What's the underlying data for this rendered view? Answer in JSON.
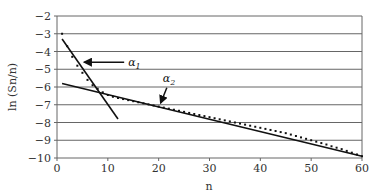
{
  "chart_data": {
    "type": "line",
    "title": "",
    "xlabel": "n",
    "ylabel": "ln (Sn/n)",
    "xlim": [
      0,
      60
    ],
    "ylim": [
      -10,
      -2
    ],
    "xticks": [
      0,
      10,
      20,
      30,
      40,
      50,
      60
    ],
    "yticks": [
      -2,
      -3,
      -4,
      -5,
      -6,
      -7,
      -8,
      -9,
      -10
    ],
    "grid": "horizontal",
    "legend": "none",
    "series": [
      {
        "name": "data",
        "style": "dotted-markers",
        "x": [
          1,
          2,
          3,
          4,
          5,
          6,
          7,
          8,
          9,
          10,
          11,
          12,
          13,
          14,
          15,
          16,
          17,
          18,
          19,
          20,
          21,
          22,
          23,
          24,
          25,
          26,
          27,
          28,
          29,
          30,
          31,
          32,
          33,
          34,
          35,
          36,
          37,
          38,
          39,
          40,
          41,
          42,
          43,
          44,
          45,
          46,
          47,
          48,
          49,
          50,
          51,
          52,
          53,
          54,
          55,
          56,
          57,
          58,
          59,
          60
        ],
        "values": [
          -3.0,
          -3.7,
          -4.3,
          -4.8,
          -5.2,
          -5.6,
          -5.9,
          -6.1,
          -6.3,
          -6.45,
          -6.55,
          -6.62,
          -6.68,
          -6.74,
          -6.8,
          -6.86,
          -6.92,
          -6.98,
          -7.04,
          -7.1,
          -7.16,
          -7.22,
          -7.28,
          -7.34,
          -7.4,
          -7.46,
          -7.52,
          -7.58,
          -7.64,
          -7.7,
          -7.76,
          -7.82,
          -7.88,
          -7.94,
          -8.0,
          -8.06,
          -8.12,
          -8.18,
          -8.24,
          -8.3,
          -8.36,
          -8.42,
          -8.48,
          -8.54,
          -8.6,
          -8.68,
          -8.76,
          -8.84,
          -8.92,
          -9.0,
          -9.08,
          -9.16,
          -9.24,
          -9.34,
          -9.42,
          -9.5,
          -9.6,
          -9.7,
          -9.8,
          -9.9
        ]
      },
      {
        "name": "α1 fit",
        "style": "solid-line",
        "x": [
          1,
          12
        ],
        "values": [
          -3.3,
          -7.8
        ]
      },
      {
        "name": "α2 fit",
        "style": "solid-line",
        "x": [
          1,
          60
        ],
        "values": [
          -5.8,
          -9.9
        ]
      }
    ],
    "annotations": [
      {
        "text": "α1",
        "base": "α",
        "sub": "1",
        "arrow_to": [
          5,
          -4.6
        ],
        "label_at": [
          14,
          -4.6
        ]
      },
      {
        "text": "α2",
        "base": "α",
        "sub": "2",
        "arrow_to": [
          20,
          -6.9
        ],
        "label_at": [
          22,
          -5.7
        ]
      }
    ]
  }
}
